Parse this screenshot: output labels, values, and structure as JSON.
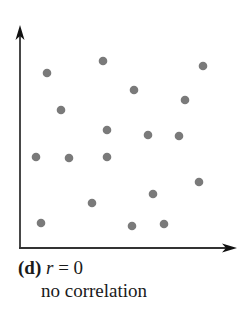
{
  "chart_data": {
    "type": "scatter",
    "title": "",
    "panel_label": "(d)",
    "r_symbol": "r",
    "equals": " = ",
    "r_value": "0",
    "subtitle": "no correlation",
    "xlabel": "",
    "ylabel": "",
    "grid": false,
    "legend": null,
    "point_color": "#7a7a7a",
    "axis_color": "#333333",
    "axes": {
      "origin_px": [
        20,
        248
      ],
      "x_arrow_tip_px": [
        236,
        248
      ],
      "y_arrow_tip_px": [
        20,
        26
      ]
    },
    "points_px": [
      [
        47,
        73
      ],
      [
        103,
        61
      ],
      [
        203,
        66
      ],
      [
        134,
        90
      ],
      [
        185,
        100
      ],
      [
        61,
        110
      ],
      [
        107,
        130
      ],
      [
        148,
        135
      ],
      [
        179,
        136
      ],
      [
        36,
        157
      ],
      [
        69,
        158
      ],
      [
        107,
        157
      ],
      [
        199,
        182
      ],
      [
        153,
        194
      ],
      [
        92,
        203
      ],
      [
        41,
        223
      ],
      [
        132,
        226
      ],
      [
        164,
        224
      ]
    ],
    "x": [
      27,
      83,
      183,
      114,
      165,
      41,
      87,
      128,
      159,
      16,
      49,
      87,
      179,
      133,
      72,
      21,
      112,
      144
    ],
    "y": [
      175,
      187,
      182,
      158,
      148,
      138,
      118,
      113,
      112,
      91,
      90,
      91,
      66,
      54,
      45,
      25,
      22,
      24
    ]
  }
}
